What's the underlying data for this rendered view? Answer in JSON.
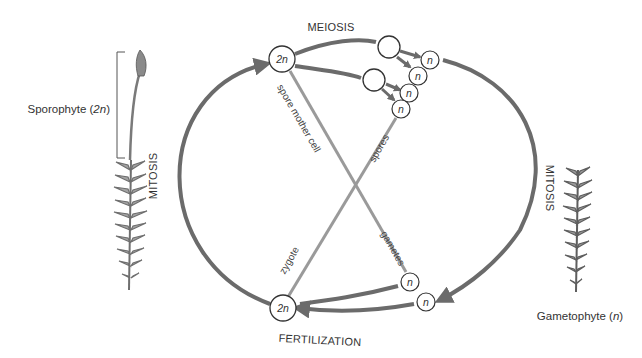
{
  "diagram": {
    "colors": {
      "cycle_stroke": "#6b6b6b",
      "cross_line": "#9a9a9a",
      "circle_fill": "#ffffff",
      "circle_stroke": "#333333",
      "plant_fill": "#8c8c8c",
      "text": "#333333"
    },
    "labels": {
      "meiosis": "MEIOSIS",
      "mitosis_left": "MITOSIS",
      "mitosis_right": "MITOSIS",
      "fertilization": "FERTILIZATION",
      "spore_mother_cell": "spore mother cell",
      "spores": "spores",
      "gametes": "gametes",
      "zygote": "zygote"
    },
    "sporophyte": {
      "label": "Sporophyte (",
      "ploidy": "2n",
      "close": ")"
    },
    "gametophyte": {
      "label": "Gametophyte (",
      "ploidy": "n",
      "close": ")"
    },
    "cells": {
      "top_diploid": "2n",
      "bottom_diploid": "2n",
      "haploid": "n"
    }
  }
}
